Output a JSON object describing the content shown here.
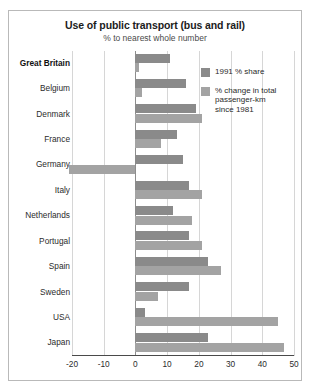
{
  "chart_data": {
    "type": "bar",
    "orientation": "horizontal",
    "title": "Use of public transport (bus and rail)",
    "subtitle": "% to nearest whole number",
    "xlabel": "",
    "ylabel": "",
    "xlim": [
      -20,
      50
    ],
    "xticks": [
      -20,
      -10,
      0,
      10,
      20,
      30,
      40,
      50
    ],
    "xtick_labels": [
      "-20",
      "-10",
      "0",
      "10",
      "20",
      "30",
      "40",
      "50"
    ],
    "grid": true,
    "legend_position": "upper-right",
    "categories": [
      "Great Britain",
      "Belgium",
      "Denmark",
      "France",
      "Germany",
      "Italy",
      "Netherlands",
      "Portugal",
      "Spain",
      "Sweden",
      "USA",
      "Japan"
    ],
    "highlight_category": "Great Britain",
    "series": [
      {
        "name": "1991 % share",
        "color": "#8a8a8a",
        "values": [
          11,
          16,
          19,
          13,
          15,
          17,
          12,
          17,
          23,
          17,
          3,
          23
        ]
      },
      {
        "name": "% change in total passenger-km since 1981",
        "color": "#a3a3a3",
        "values": [
          1,
          2,
          21,
          8,
          -21,
          21,
          18,
          21,
          27,
          7,
          45,
          47
        ]
      }
    ]
  },
  "legend": {
    "items": [
      {
        "label": "1991 % share",
        "swatch": "share"
      },
      {
        "label": "% change in total passenger-km since 1981",
        "swatch": "change"
      }
    ]
  }
}
